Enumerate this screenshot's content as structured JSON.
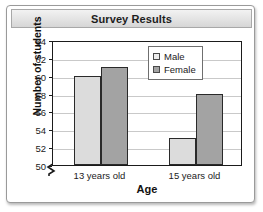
{
  "chart_data": {
    "type": "bar",
    "title": "Survey Results",
    "xlabel": "Age",
    "ylabel": "Number of students",
    "categories": [
      "13 years old",
      "15 years old"
    ],
    "series": [
      {
        "name": "Male",
        "values": [
          60,
          53
        ],
        "color": "#dcdcdc"
      },
      {
        "name": "Female",
        "values": [
          61,
          58
        ],
        "color": "#a3a3a3"
      }
    ],
    "ylim": [
      50,
      64
    ],
    "ytick_step": 2,
    "yticks": [
      50,
      52,
      54,
      56,
      58,
      60,
      62,
      64
    ],
    "ytick_labels": [
      "50",
      "52",
      "54",
      "56",
      "58",
      "60",
      "62",
      "64"
    ],
    "axis_break": true,
    "axis_break_symbol": "zigzag",
    "grid": "horizontal",
    "legend_position": "top-right",
    "legend_entries": [
      "Male",
      "Female"
    ]
  }
}
